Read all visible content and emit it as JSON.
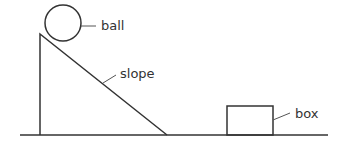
{
  "diagram": {
    "labels": {
      "ball": "ball",
      "slope": "slope",
      "box": "box"
    },
    "colors": {
      "stroke": "#333333",
      "background": "#ffffff"
    }
  }
}
